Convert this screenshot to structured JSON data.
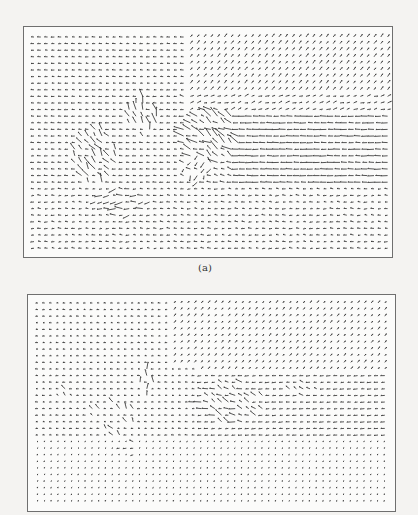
{
  "figure": {
    "panels": [
      {
        "id": "a",
        "caption": "(a)",
        "frame": {
          "x": 23,
          "y": 26,
          "w": 370,
          "h": 232
        },
        "caption_pos": {
          "x": 205,
          "y": 262
        },
        "grid": {
          "x0": 10,
          "y0": 10,
          "dx": 6.8,
          "dy": 6.6,
          "cols": 53,
          "rows": 33
        },
        "base_length": 3.2,
        "regions": [
          {
            "name": "upper-left-leftward",
            "c0": 0,
            "c1": 22,
            "r0": 0,
            "r1": 9,
            "angle": 180,
            "len": 3.0
          },
          {
            "name": "upper-right-diagonal",
            "c0": 23,
            "c1": 53,
            "r0": 0,
            "r1": 9,
            "angle": -55,
            "len": 3.4
          },
          {
            "name": "middle-left-leftward",
            "c0": 0,
            "c1": 22,
            "r0": 9,
            "r1": 27,
            "angle": 180,
            "len": 3.2
          },
          {
            "name": "middle-right-long-leftward",
            "c0": 30,
            "c1": 53,
            "r0": 12,
            "r1": 23,
            "angle": 180,
            "len": 5.8
          },
          {
            "name": "middle-band-mixed",
            "c0": 22,
            "c1": 30,
            "r0": 9,
            "r1": 23,
            "angle": 190,
            "len": 4.0,
            "jitter": 40
          },
          {
            "name": "upper-right-transition",
            "c0": 23,
            "c1": 53,
            "r0": 9,
            "r1": 12,
            "angle": -20,
            "len": 3.6,
            "jitter": 30
          },
          {
            "name": "lower-leftward",
            "c0": 0,
            "c1": 53,
            "r0": 23,
            "r1": 33,
            "angle": 180,
            "len": 3.0,
            "jitter": 25
          }
        ],
        "blobs": [
          {
            "name": "left-swirl",
            "cx": 9,
            "cy": 18,
            "rx": 3,
            "ry": 4,
            "angle": 235,
            "len": 7.5
          },
          {
            "name": "left-vertical-streaks",
            "cx": 16,
            "cy": 12,
            "rx": 2,
            "ry": 3,
            "angle": 250,
            "len": 8
          },
          {
            "name": "center-swirl",
            "cx": 26,
            "cy": 15,
            "rx": 4,
            "ry": 4,
            "angle": 215,
            "len": 9
          },
          {
            "name": "center-low-swirl",
            "cx": 24,
            "cy": 20,
            "rx": 2,
            "ry": 2,
            "angle": 120,
            "len": 5
          },
          {
            "name": "bottom-left-streaks",
            "cx": 13,
            "cy": 25,
            "rx": 4,
            "ry": 2,
            "angle": 175,
            "len": 7
          }
        ]
      },
      {
        "id": "b",
        "caption": "",
        "frame": {
          "x": 27,
          "y": 294,
          "w": 369,
          "h": 218
        },
        "grid": {
          "x0": 10,
          "y0": 8,
          "dx": 6.8,
          "dy": 6.6,
          "cols": 53,
          "rows": 32
        },
        "base_length": 2.4,
        "regions": [
          {
            "name": "upper-left-leftward",
            "c0": 0,
            "c1": 20,
            "r0": 0,
            "r1": 10,
            "angle": 180,
            "len": 2.2
          },
          {
            "name": "upper-right-diagonal",
            "c0": 20,
            "c1": 53,
            "r0": 0,
            "r1": 11,
            "angle": -55,
            "len": 2.6
          },
          {
            "name": "middle-left-leftward",
            "c0": 0,
            "c1": 24,
            "r0": 10,
            "r1": 22,
            "angle": 180,
            "len": 2.4
          },
          {
            "name": "middle-right-leftward",
            "c0": 24,
            "c1": 53,
            "r0": 11,
            "r1": 21,
            "angle": 175,
            "len": 3.6
          },
          {
            "name": "lower-dots",
            "c0": 0,
            "c1": 53,
            "r0": 21,
            "r1": 32,
            "angle": 180,
            "len": 1.0,
            "jitter": 20
          }
        ],
        "blobs": [
          {
            "name": "left-swirl",
            "cx": 11,
            "cy": 17,
            "rx": 3,
            "ry": 3,
            "angle": 235,
            "len": 5
          },
          {
            "name": "left-vertical-streaks",
            "cx": 16,
            "cy": 12,
            "rx": 1,
            "ry": 2,
            "angle": 260,
            "len": 6
          },
          {
            "name": "left-small",
            "cx": 4,
            "cy": 14,
            "rx": 1,
            "ry": 1,
            "angle": 225,
            "len": 4
          },
          {
            "name": "center-swirl",
            "cx": 28,
            "cy": 15,
            "rx": 5,
            "ry": 3,
            "angle": 200,
            "len": 6
          },
          {
            "name": "right-diagonal-streak",
            "cx": 39,
            "cy": 13,
            "rx": 2,
            "ry": 1,
            "angle": 210,
            "len": 5
          },
          {
            "name": "bottom-left-streak",
            "cx": 14,
            "cy": 22,
            "rx": 2,
            "ry": 1,
            "angle": 185,
            "len": 4
          }
        ]
      }
    ],
    "colors": {
      "ink": "#2a2a2a",
      "frame": "#6f6f6f",
      "paper": "#f4f3f1"
    }
  }
}
